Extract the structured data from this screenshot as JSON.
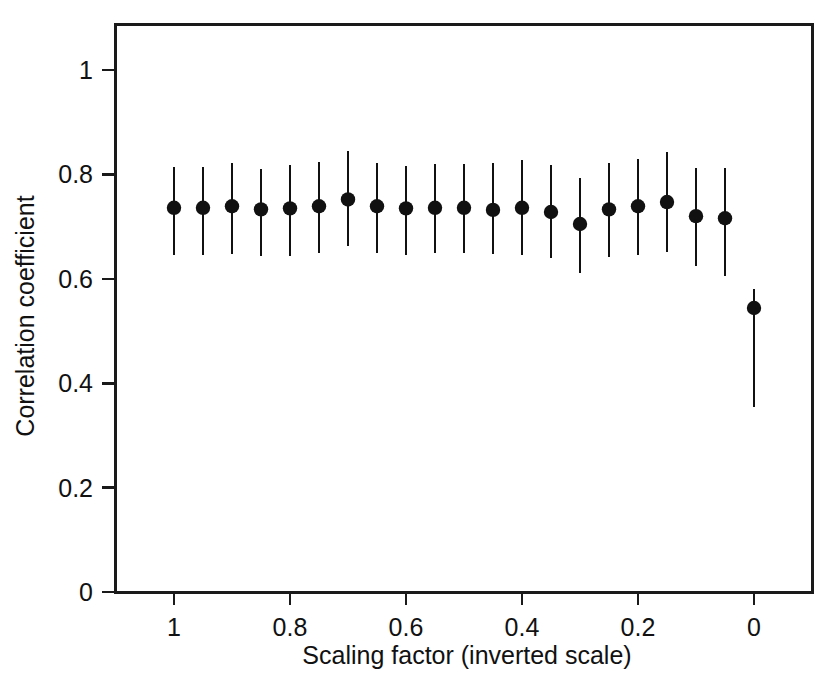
{
  "chart_data": {
    "type": "scatter",
    "title": "",
    "xlabel": "Scaling factor (inverted scale)",
    "ylabel": "Correlation coefficient",
    "xlim": [
      1.06,
      -0.06
    ],
    "ylim": [
      0,
      1.09
    ],
    "inverted_x": true,
    "grid": false,
    "legend": null,
    "xticks": [
      1,
      0.8,
      0.6,
      0.4,
      0.2,
      0
    ],
    "xtick_labels": [
      "1",
      "0.8",
      "0.6",
      "0.4",
      "0.2",
      "0"
    ],
    "yticks": [
      0,
      0.2,
      0.4,
      0.6,
      0.8,
      1
    ],
    "ytick_labels": [
      "0",
      "0.2",
      "0.4",
      "0.6",
      "0.8",
      "1"
    ],
    "marker": "filled-circle",
    "error_style": "vertical-line",
    "series": [
      {
        "name": "Correlation coefficient vs scaling factor",
        "x": [
          1.0,
          0.95,
          0.9,
          0.85,
          0.8,
          0.75,
          0.7,
          0.65,
          0.6,
          0.55,
          0.5,
          0.45,
          0.4,
          0.35,
          0.3,
          0.25,
          0.2,
          0.15,
          0.1,
          0.05,
          0.0
        ],
        "values": [
          0.736,
          0.736,
          0.739,
          0.733,
          0.735,
          0.739,
          0.752,
          0.739,
          0.735,
          0.736,
          0.736,
          0.732,
          0.736,
          0.728,
          0.705,
          0.733,
          0.739,
          0.747,
          0.72,
          0.716,
          0.544
        ],
        "err_low": [
          0.645,
          0.645,
          0.648,
          0.643,
          0.643,
          0.65,
          0.662,
          0.649,
          0.645,
          0.65,
          0.649,
          0.647,
          0.645,
          0.64,
          0.612,
          0.641,
          0.646,
          0.651,
          0.624,
          0.605,
          0.355
        ],
        "err_high": [
          0.814,
          0.814,
          0.822,
          0.811,
          0.818,
          0.824,
          0.845,
          0.822,
          0.816,
          0.82,
          0.82,
          0.822,
          0.828,
          0.818,
          0.793,
          0.822,
          0.83,
          0.843,
          0.812,
          0.812,
          0.58
        ]
      }
    ]
  },
  "figure": {
    "background_color": "#ffffff",
    "ink_color": "#111111"
  }
}
